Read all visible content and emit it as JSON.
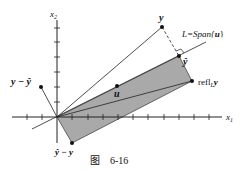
{
  "figure": {
    "caption_prefix": "图",
    "caption_number": "6-16"
  },
  "axes": {
    "x_label": "x",
    "x_sub": "1",
    "y_label": "x",
    "y_sub": "2"
  },
  "labels": {
    "y": "y",
    "y_hat": "ŷ",
    "line_L": "L=Span{",
    "line_u": "u",
    "line_close": "}",
    "refl_prefix": "refl",
    "refl_sub": "L",
    "refl_vec": "y",
    "u": "u",
    "y_minus_yhat": "y − ŷ",
    "yhat_minus_y": "ŷ − y"
  },
  "colors": {
    "shade": "#a9a9a9",
    "line": "#222222",
    "point": "#111111"
  }
}
